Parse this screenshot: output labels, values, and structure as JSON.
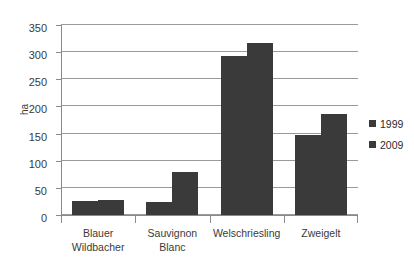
{
  "chart_data": {
    "type": "bar",
    "title": "",
    "subtitle": "",
    "xlabel": "",
    "ylabel": "ha",
    "ylim": [
      0,
      350
    ],
    "ytick_step": 50,
    "yticks": [
      0,
      50,
      100,
      150,
      200,
      250,
      300,
      350
    ],
    "ytick_labels": [
      "0",
      "50",
      "100",
      "150",
      "200",
      "250",
      "300",
      "350"
    ],
    "grid": true,
    "grid_axis": "y",
    "legend_position": "right",
    "categories": [
      "Blauer Wildbacher",
      "Sauvignon Blanc",
      "Welschriesling",
      "Zweigelt"
    ],
    "category_label_lines": [
      [
        "Blauer",
        "Wildbacher"
      ],
      [
        "Sauvignon",
        "Blanc"
      ],
      [
        "Welschriesling"
      ],
      [
        "Zweigelt"
      ]
    ],
    "series": [
      {
        "name": "1999",
        "color": "#3a3a3a",
        "values": [
          25,
          24,
          293,
          148
        ]
      },
      {
        "name": "2009",
        "color": "#3a3a3a",
        "values": [
          28,
          79,
          317,
          186
        ]
      }
    ],
    "annotations": []
  },
  "legend": {
    "entries": [
      {
        "label": "1999",
        "color": "#3a3a3a"
      },
      {
        "label": "2009",
        "color": "#3a3a3a"
      }
    ]
  },
  "style": {
    "bar_color": "#3a3a3a",
    "grid_color": "#9a9a9a",
    "axis_color": "#8a8a8a",
    "text_color": "#3a3a3a",
    "background": "#ffffff"
  }
}
